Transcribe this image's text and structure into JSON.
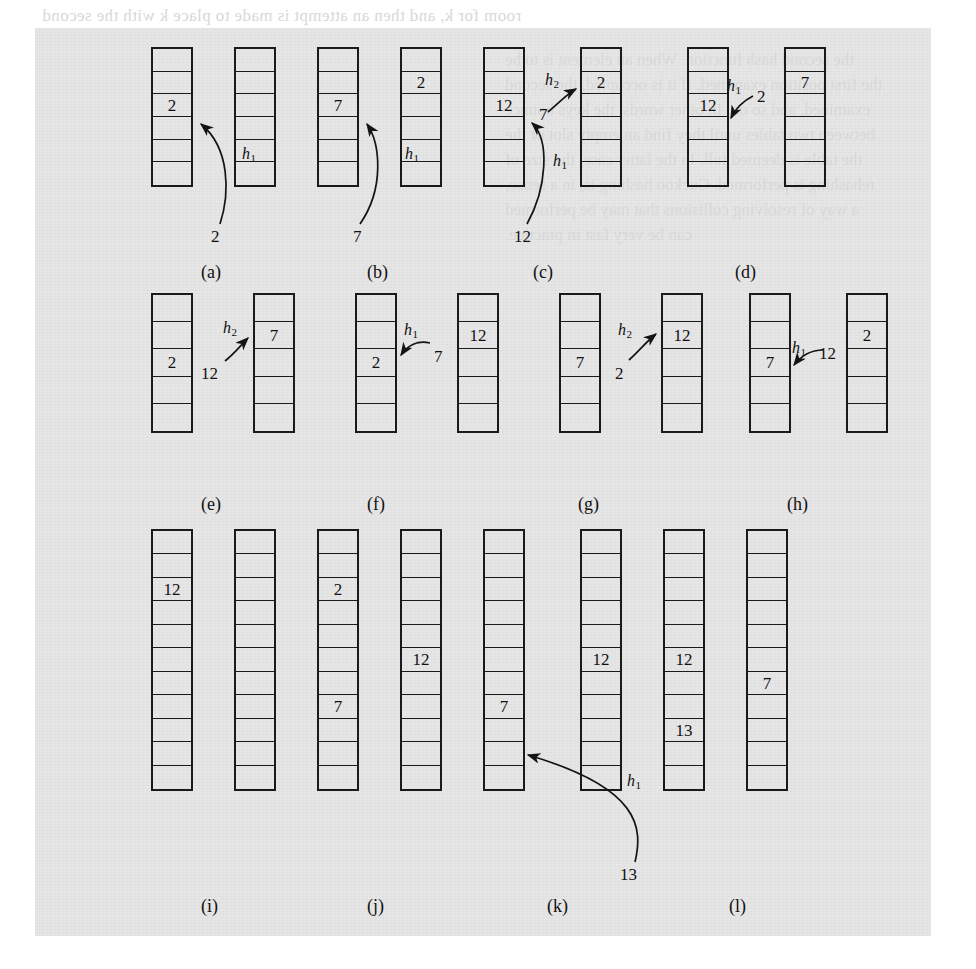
{
  "figure": {
    "caption_letters": [
      "(a)",
      "(b)",
      "(c)",
      "(d)",
      "(e)",
      "(f)",
      "(g)",
      "(h)",
      "(i)",
      "(j)",
      "(k)",
      "(l)"
    ],
    "hash_labels": {
      "h1": "h",
      "h1_sub": "1",
      "h2": "h",
      "h2_sub": "2"
    }
  },
  "bleed_text": {
    "top1": "room for k, and then an attempt is made to place k with the second",
    "line_right": [
      "the second hash function. When an element is to be",
      "the first position examined. If it is occupied, the second",
      "examined, and so on. In other words, the keys bounce",
      "between two tables until they find an empty slot or the",
      "the table is deemed full. In the latter case, the size of",
      "rehashing is performed. Cuckoo hashing is, in a sense,",
      "a way of resolving collisions that may be performed",
      "can be very fast in practice."
    ]
  },
  "panels": [
    {
      "id": "a",
      "label": "(a)",
      "tables": [
        {
          "rows": 6,
          "values": {
            "2": "2"
          }
        },
        {
          "rows": 6,
          "values": {}
        }
      ],
      "annotations": [
        {
          "kind": "key",
          "text": "2"
        },
        {
          "kind": "hash",
          "text": "h",
          "sub": "1"
        }
      ]
    },
    {
      "id": "b",
      "label": "(b)",
      "tables": [
        {
          "rows": 6,
          "values": {
            "2": "7"
          }
        },
        {
          "rows": 6,
          "values": {
            "1": "2"
          }
        }
      ],
      "annotations": [
        {
          "kind": "key",
          "text": "7"
        },
        {
          "kind": "hash",
          "text": "h",
          "sub": "1"
        }
      ]
    },
    {
      "id": "c",
      "label": "(c)",
      "tables": [
        {
          "rows": 6,
          "values": {
            "2": "12"
          }
        },
        {
          "rows": 6,
          "values": {
            "1": "2"
          }
        }
      ],
      "annotations": [
        {
          "kind": "key",
          "text": "12"
        },
        {
          "kind": "key",
          "text": "7"
        },
        {
          "kind": "hash",
          "text": "h",
          "sub": "1"
        },
        {
          "kind": "hash",
          "text": "h",
          "sub": "2"
        }
      ]
    },
    {
      "id": "d",
      "label": "(d)",
      "tables": [
        {
          "rows": 6,
          "values": {
            "2": "12"
          }
        },
        {
          "rows": 6,
          "values": {
            "1": "7"
          }
        }
      ],
      "annotations": [
        {
          "kind": "key",
          "text": "2"
        },
        {
          "kind": "hash",
          "text": "h",
          "sub": "1"
        }
      ]
    },
    {
      "id": "e",
      "label": "(e)",
      "tables": [
        {
          "rows": 5,
          "values": {
            "2": "2"
          }
        },
        {
          "rows": 5,
          "values": {
            "1": "7"
          }
        }
      ],
      "annotations": [
        {
          "kind": "key",
          "text": "12"
        },
        {
          "kind": "hash",
          "text": "h",
          "sub": "2"
        }
      ]
    },
    {
      "id": "f",
      "label": "(f)",
      "tables": [
        {
          "rows": 5,
          "values": {
            "2": "2"
          }
        },
        {
          "rows": 5,
          "values": {
            "1": "12"
          }
        }
      ],
      "annotations": [
        {
          "kind": "key",
          "text": "7"
        },
        {
          "kind": "hash",
          "text": "h",
          "sub": "1"
        }
      ]
    },
    {
      "id": "g",
      "label": "(g)",
      "tables": [
        {
          "rows": 5,
          "values": {
            "2": "7"
          }
        },
        {
          "rows": 5,
          "values": {
            "1": "12"
          }
        }
      ],
      "annotations": [
        {
          "kind": "key",
          "text": "2"
        },
        {
          "kind": "hash",
          "text": "h",
          "sub": "2"
        }
      ]
    },
    {
      "id": "h",
      "label": "(h)",
      "tables": [
        {
          "rows": 5,
          "values": {
            "2": "7"
          }
        },
        {
          "rows": 5,
          "values": {
            "1": "2"
          }
        }
      ],
      "annotations": [
        {
          "kind": "key",
          "text": "12"
        },
        {
          "kind": "hash",
          "text": "h",
          "sub": "1"
        }
      ]
    },
    {
      "id": "i",
      "label": "(i)",
      "tables": [
        {
          "rows": 11,
          "values": {
            "2": "12"
          }
        },
        {
          "rows": 11,
          "values": {}
        }
      ],
      "annotations": []
    },
    {
      "id": "j",
      "label": "(j)",
      "tables": [
        {
          "rows": 11,
          "values": {
            "2": "2",
            "7": "7"
          }
        },
        {
          "rows": 11,
          "values": {
            "5": "12"
          }
        }
      ],
      "annotations": []
    },
    {
      "id": "k",
      "label": "(k)",
      "tables": [
        {
          "rows": 11,
          "values": {
            "7": "7"
          }
        },
        {
          "rows": 11,
          "values": {
            "5": "12",
            "8": "13"
          }
        }
      ],
      "annotations": [
        {
          "kind": "key",
          "text": "13"
        },
        {
          "kind": "hash",
          "text": "h",
          "sub": "1"
        }
      ]
    },
    {
      "id": "l",
      "label": "(l)",
      "tables": [
        {
          "rows": 11,
          "values": {
            "6": "7"
          }
        }
      ],
      "annotations": []
    }
  ],
  "cells": {
    "r1": [
      {
        "name": "a-t1",
        "x": 116,
        "y": 19,
        "w": 42,
        "h": 140,
        "rows": 6,
        "values": {
          "2": "2"
        }
      },
      {
        "name": "a-t2",
        "x": 199,
        "y": 19,
        "w": 42,
        "h": 140,
        "rows": 6,
        "values": {}
      },
      {
        "name": "b-t1",
        "x": 282,
        "y": 19,
        "w": 42,
        "h": 140,
        "rows": 6,
        "values": {
          "2": "7"
        }
      },
      {
        "name": "b-t2",
        "x": 365,
        "y": 19,
        "w": 42,
        "h": 140,
        "rows": 6,
        "values": {
          "1": "2"
        }
      },
      {
        "name": "c-t1",
        "x": 448,
        "y": 19,
        "w": 42,
        "h": 140,
        "rows": 6,
        "values": {
          "2": "12"
        }
      },
      {
        "name": "c-t2",
        "x": 545,
        "y": 19,
        "w": 42,
        "h": 140,
        "rows": 6,
        "values": {
          "1": "2"
        }
      },
      {
        "name": "d-t1",
        "x": 652,
        "y": 19,
        "w": 42,
        "h": 140,
        "rows": 6,
        "values": {
          "2": "12"
        }
      },
      {
        "name": "d-t2",
        "x": 749,
        "y": 19,
        "w": 42,
        "h": 140,
        "rows": 6,
        "values": {
          "1": "7"
        }
      }
    ],
    "r2": [
      {
        "name": "e-t1",
        "x": 116,
        "y": 265,
        "w": 42,
        "h": 140,
        "rows": 5,
        "values": {
          "2": "2"
        }
      },
      {
        "name": "e-t2",
        "x": 218,
        "y": 265,
        "w": 42,
        "h": 140,
        "rows": 5,
        "values": {
          "1": "7"
        }
      },
      {
        "name": "f-t1",
        "x": 320,
        "y": 265,
        "w": 42,
        "h": 140,
        "rows": 5,
        "values": {
          "2": "2"
        }
      },
      {
        "name": "f-t2",
        "x": 422,
        "y": 265,
        "w": 42,
        "h": 140,
        "rows": 5,
        "values": {
          "1": "12"
        }
      },
      {
        "name": "g-t1",
        "x": 524,
        "y": 265,
        "w": 42,
        "h": 140,
        "rows": 5,
        "values": {
          "2": "7"
        }
      },
      {
        "name": "g-t2",
        "x": 626,
        "y": 265,
        "w": 42,
        "h": 140,
        "rows": 5,
        "values": {
          "1": "12"
        }
      },
      {
        "name": "h-t1",
        "x": 714,
        "y": 265,
        "w": 42,
        "h": 140,
        "rows": 5,
        "values": {
          "2": "7"
        }
      },
      {
        "name": "h-t2",
        "x": 811,
        "y": 265,
        "w": 42,
        "h": 140,
        "rows": 5,
        "values": {
          "1": "2"
        }
      }
    ],
    "r3": [
      {
        "name": "i-t1",
        "x": 116,
        "y": 501,
        "w": 42,
        "h": 262,
        "rows": 11,
        "values": {
          "2": "12"
        }
      },
      {
        "name": "i-t2",
        "x": 199,
        "y": 501,
        "w": 42,
        "h": 262,
        "rows": 11,
        "values": {}
      },
      {
        "name": "j-t1",
        "x": 282,
        "y": 501,
        "w": 42,
        "h": 262,
        "rows": 11,
        "values": {
          "2": "2",
          "7": "7"
        }
      },
      {
        "name": "j-t2",
        "x": 365,
        "y": 501,
        "w": 42,
        "h": 262,
        "rows": 11,
        "values": {
          "5": "12"
        }
      },
      {
        "name": "k-t1",
        "x": 448,
        "y": 501,
        "w": 42,
        "h": 262,
        "rows": 11,
        "values": {
          "7": "7"
        }
      },
      {
        "name": "k-t2",
        "x": 545,
        "y": 501,
        "w": 42,
        "h": 262,
        "rows": 11,
        "values": {
          "5": "12"
        }
      },
      {
        "name": "l-t1",
        "x": 628,
        "y": 501,
        "w": 42,
        "h": 262,
        "rows": 11,
        "values": {
          "5": "12",
          "8": "13"
        }
      },
      {
        "name": "l-t2",
        "x": 711,
        "y": 501,
        "w": 42,
        "h": 262,
        "rows": 11,
        "values": {
          "6": "7"
        }
      }
    ]
  },
  "labels": {
    "r1": [
      {
        "name": "key-2-a",
        "x": 176,
        "y": 200,
        "text": "2"
      },
      {
        "name": "hash-h1-a",
        "x": 207,
        "y": 118,
        "text": "h",
        "sub": "1"
      },
      {
        "name": "key-7-b",
        "x": 318,
        "y": 200,
        "text": "7"
      },
      {
        "name": "hash-h1-b",
        "x": 370,
        "y": 118,
        "text": "h",
        "sub": "1"
      },
      {
        "name": "key-12-c",
        "x": 479,
        "y": 200,
        "text": "12"
      },
      {
        "name": "hash-h1-c",
        "x": 518,
        "y": 125,
        "text": "h",
        "sub": "1"
      },
      {
        "name": "key-7-c",
        "x": 504,
        "y": 78,
        "text": "7"
      },
      {
        "name": "hash-h2-c",
        "x": 510,
        "y": 44,
        "text": "h",
        "sub": "2"
      },
      {
        "name": "key-2-d",
        "x": 722,
        "y": 60,
        "text": "2"
      },
      {
        "name": "hash-h1-d",
        "x": 692,
        "y": 50,
        "text": "h",
        "sub": "1"
      }
    ],
    "r2": [
      {
        "name": "key-12-e",
        "x": 166,
        "y": 337,
        "text": "12"
      },
      {
        "name": "hash-h2-e",
        "x": 188,
        "y": 292,
        "text": "h",
        "sub": "2"
      },
      {
        "name": "key-7-f",
        "x": 399,
        "y": 320,
        "text": "7"
      },
      {
        "name": "hash-h1-f",
        "x": 369,
        "y": 294,
        "text": "h",
        "sub": "1"
      },
      {
        "name": "key-2-g",
        "x": 580,
        "y": 337,
        "text": "2"
      },
      {
        "name": "hash-h2-g",
        "x": 583,
        "y": 294,
        "text": "h",
        "sub": "2"
      },
      {
        "name": "key-12-h",
        "x": 784,
        "y": 317,
        "text": "12"
      },
      {
        "name": "hash-h1-h",
        "x": 757,
        "y": 312,
        "text": "h",
        "sub": "1"
      }
    ],
    "r3": [
      {
        "name": "key-13-k",
        "x": 585,
        "y": 838,
        "text": "13"
      },
      {
        "name": "hash-h1-k",
        "x": 592,
        "y": 745,
        "text": "h",
        "sub": "1"
      }
    ]
  },
  "panel_labels": [
    {
      "name": "panel-label-a",
      "text": "(a)",
      "x": 166,
      "y": 234
    },
    {
      "name": "panel-label-b",
      "text": "(b)",
      "x": 332,
      "y": 234
    },
    {
      "name": "panel-label-c",
      "text": "(c)",
      "x": 498,
      "y": 234
    },
    {
      "name": "panel-label-d",
      "text": "(d)",
      "x": 700,
      "y": 234
    },
    {
      "name": "panel-label-e",
      "text": "(e)",
      "x": 166,
      "y": 466
    },
    {
      "name": "panel-label-f",
      "text": "(f)",
      "x": 332,
      "y": 466
    },
    {
      "name": "panel-label-g",
      "text": "(g)",
      "x": 543,
      "y": 466
    },
    {
      "name": "panel-label-h",
      "text": "(h)",
      "x": 752,
      "y": 466
    },
    {
      "name": "panel-label-i",
      "text": "(i)",
      "x": 166,
      "y": 868
    },
    {
      "name": "panel-label-j",
      "text": "(j)",
      "x": 332,
      "y": 868
    },
    {
      "name": "panel-label-k",
      "text": "(k)",
      "x": 512,
      "y": 868
    },
    {
      "name": "panel-label-l",
      "text": "(l)",
      "x": 694,
      "y": 868
    }
  ]
}
